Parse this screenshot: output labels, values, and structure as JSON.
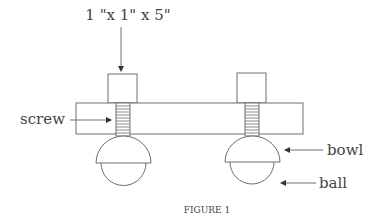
{
  "labels": {
    "dimension": "1 \"x 1\" x 5\"",
    "screw": "screw",
    "bowl": "bowl",
    "ball": "ball"
  },
  "caption": "FIGURE 1",
  "colors": {
    "line": "#6e6e6e",
    "text": "#444444",
    "background": "#ffffff"
  }
}
